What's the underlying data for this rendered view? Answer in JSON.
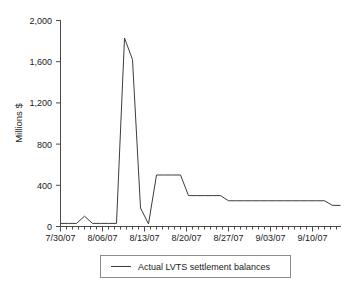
{
  "chart_data": {
    "type": "line",
    "title": "",
    "subtitle": "",
    "xlabel": "",
    "ylabel": "Millions $",
    "ylim": [
      0,
      2000
    ],
    "yticks": [
      0,
      400,
      800,
      1200,
      1600,
      2000
    ],
    "ytick_labels": [
      "0",
      "400",
      "800",
      "1,200",
      "1,600",
      "2,000"
    ],
    "xtick_labels": [
      "7/30/07",
      "8/06/07",
      "8/13/07",
      "8/20/07",
      "8/27/07",
      "9/03/07",
      "9/10/07"
    ],
    "xlim": [
      "7/30/07",
      "9/17/07"
    ],
    "grid": false,
    "legend_position": "below-center",
    "legend": [
      "Actual LVTS settlement balances"
    ],
    "line_color": "#3c3c3c",
    "axis_color": "#4a4a4a",
    "series": [
      {
        "name": "Actual LVTS settlement balances",
        "x": [
          "7/30/07",
          "7/31/07",
          "8/01/07",
          "8/02/07",
          "8/03/07",
          "8/06/07",
          "8/07/07",
          "8/08/07",
          "8/09/07",
          "8/10/07",
          "8/13/07",
          "8/14/07",
          "8/15/07",
          "8/16/07",
          "8/17/07",
          "8/20/07",
          "8/21/07",
          "8/22/07",
          "8/23/07",
          "8/24/07",
          "8/27/07",
          "8/28/07",
          "8/29/07",
          "8/30/07",
          "8/31/07",
          "9/03/07",
          "9/04/07",
          "9/05/07",
          "9/06/07",
          "9/07/07",
          "9/10/07",
          "9/11/07",
          "9/12/07",
          "9/13/07",
          "9/14/07",
          "9/17/07"
        ],
        "values": [
          30,
          30,
          30,
          100,
          30,
          30,
          30,
          30,
          1830,
          1620,
          180,
          25,
          500,
          500,
          500,
          500,
          300,
          300,
          300,
          300,
          300,
          250,
          250,
          250,
          250,
          250,
          250,
          250,
          250,
          250,
          250,
          250,
          250,
          250,
          205,
          205
        ]
      }
    ]
  }
}
